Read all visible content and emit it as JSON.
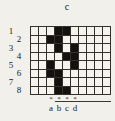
{
  "figure": {
    "title": "c",
    "row_labels": [
      "1",
      "2",
      "3",
      "4",
      "5",
      "6",
      "7",
      "8"
    ],
    "col_marks": [
      "*",
      "*",
      "*",
      "*"
    ],
    "col_labels": [
      "a",
      "b",
      "c",
      "d"
    ],
    "grid": {
      "cols": 10,
      "rows": 8,
      "fill_char": "X",
      "pattern": [
        "...XX.....",
        "..XX......",
        "...X.X....",
        "....XX....",
        "..X..X....",
        "..XX......",
        "...X......",
        "...XX....."
      ]
    },
    "colors": {
      "paper": "#f2f0ea",
      "ink": "#21201d",
      "grid_line": "#34312c",
      "cell_fill": "#141210"
    }
  }
}
